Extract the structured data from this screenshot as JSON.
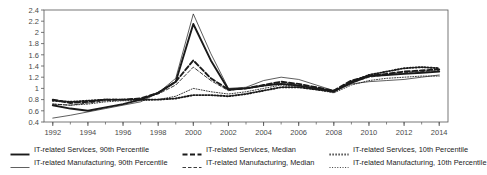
{
  "chart_data": {
    "type": "line",
    "title": "",
    "xlabel": "",
    "ylabel": "",
    "xlim": [
      1991.5,
      2014.5
    ],
    "ylim": [
      0.4,
      2.4
    ],
    "grid": false,
    "legend_position": "bottom",
    "x": [
      1992,
      1993,
      1994,
      1995,
      1996,
      1997,
      1998,
      1999,
      2000,
      2001,
      2002,
      2003,
      2004,
      2005,
      2006,
      2007,
      2008,
      2009,
      2010,
      2011,
      2012,
      2013,
      2014
    ],
    "xticks": [
      1992,
      1994,
      1996,
      1998,
      2000,
      2002,
      2004,
      2006,
      2008,
      2010,
      2012,
      2014
    ],
    "yticks": [
      "0.4",
      "0.6",
      "0.8",
      "1",
      "1.2",
      "1.4",
      "1.6",
      "1.8",
      "2",
      "2.2",
      "2.4"
    ],
    "series": [
      {
        "name": "IT-related Services, 90th Percentile",
        "style": "thick-solid",
        "values": [
          0.7,
          0.64,
          0.6,
          0.66,
          0.72,
          0.8,
          0.92,
          1.12,
          2.15,
          1.5,
          0.98,
          1.0,
          1.05,
          1.08,
          1.05,
          1.0,
          0.95,
          1.1,
          1.22,
          1.24,
          1.26,
          1.28,
          1.3
        ]
      },
      {
        "name": "IT-related Services, Median",
        "style": "thick-dashed",
        "values": [
          0.8,
          0.74,
          0.76,
          0.8,
          0.8,
          0.82,
          0.92,
          1.12,
          1.5,
          1.18,
          0.98,
          1.0,
          1.06,
          1.12,
          1.08,
          1.02,
          0.96,
          1.14,
          1.22,
          1.26,
          1.3,
          1.32,
          1.34
        ]
      },
      {
        "name": "IT-related Services, 10th Percentile",
        "style": "thick-dotted",
        "values": [
          0.78,
          0.76,
          0.78,
          0.8,
          0.8,
          0.8,
          0.8,
          0.82,
          0.88,
          0.88,
          0.86,
          0.9,
          0.96,
          1.02,
          1.02,
          0.98,
          0.94,
          1.12,
          1.24,
          1.3,
          1.36,
          1.38,
          1.36
        ]
      },
      {
        "name": "IT-related Manufacturing, 90th Percentile",
        "style": "thin-solid",
        "values": [
          0.47,
          0.52,
          0.58,
          0.64,
          0.7,
          0.76,
          0.92,
          1.18,
          2.33,
          1.62,
          1.0,
          1.02,
          1.14,
          1.2,
          1.16,
          1.06,
          0.96,
          1.08,
          1.12,
          1.14,
          1.16,
          1.2,
          1.24
        ]
      },
      {
        "name": "IT-related Manufacturing, Median",
        "style": "thin-dashed",
        "values": [
          0.72,
          0.7,
          0.74,
          0.78,
          0.8,
          0.82,
          0.9,
          1.06,
          1.38,
          1.14,
          0.96,
          1.0,
          1.04,
          1.1,
          1.06,
          1.0,
          0.94,
          1.1,
          1.2,
          1.24,
          1.28,
          1.3,
          1.32
        ]
      },
      {
        "name": "IT-related Manufacturing, 10th Percentile",
        "style": "thin-dotted",
        "values": [
          0.72,
          0.7,
          0.72,
          0.76,
          0.78,
          0.78,
          0.8,
          0.86,
          1.0,
          0.94,
          0.9,
          0.94,
          1.0,
          1.06,
          1.04,
          0.98,
          0.92,
          1.06,
          1.14,
          1.18,
          1.2,
          1.22,
          1.22
        ]
      }
    ]
  },
  "legend": {
    "rows": [
      [
        {
          "label": "IT-related Services, 90th Percentile",
          "style": "thick-solid"
        },
        {
          "label": "IT-related Services, Median",
          "style": "thick-dashed"
        },
        {
          "label": "IT-related Services, 10th Percentile",
          "style": "thick-dotted"
        }
      ],
      [
        {
          "label": "IT-related Manufacturing, 90th Percentile",
          "style": "thin-solid"
        },
        {
          "label": "IT-related Manufacturing, Median",
          "style": "thin-dashed"
        },
        {
          "label": "IT-related Manufacturing, 10th Percentile",
          "style": "thin-dotted"
        }
      ]
    ]
  },
  "colors": {
    "line": "#1a1a1a",
    "axis": "#555555",
    "background": "#ffffff"
  }
}
